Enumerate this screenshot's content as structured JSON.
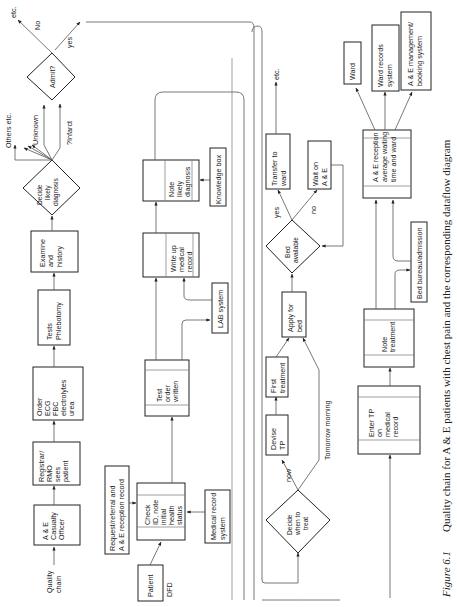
{
  "caption": {
    "figure_label": "Figure 6.1",
    "text": "Quality chain for A & E patients with chest pain and the corresponding dataflow diagram"
  },
  "quality_chain": {
    "label_line1": "Quality",
    "label_line2": "chain",
    "steps": [
      {
        "lines": [
          "A & E",
          "Casualty",
          "Officer"
        ]
      },
      {
        "lines": [
          "Registrar/",
          "RMO",
          "sees",
          "patient"
        ]
      },
      {
        "lines": [
          "Order",
          "ECG",
          "FBC",
          "electrolytes",
          "urea"
        ]
      },
      {
        "lines": [
          "Tests",
          "Phlebotomy"
        ]
      },
      {
        "lines": [
          "Examine",
          "and",
          "history"
        ]
      }
    ],
    "decide_diagnosis": {
      "lines": [
        "Decide",
        "likely",
        "diagnosis"
      ]
    },
    "diagnosis_branches": {
      "others": "Others etc.",
      "unknown": "Unknown",
      "infarct": "?Infarct"
    },
    "admit": {
      "label": "Admit?",
      "no": "No",
      "yes": "yes",
      "etc": "etc."
    }
  },
  "dfd": {
    "label": "DFD",
    "externals": {
      "patient": "Patient",
      "request": [
        "Request/referral and",
        "A & E reception record"
      ],
      "medical_record_system": [
        "Medical record",
        "system"
      ],
      "lab_system": "LAB system",
      "knowledge_box": "Knowledge box"
    },
    "processes": [
      {
        "lines": [
          "Check",
          "ID, note",
          "initial",
          "health",
          "status"
        ]
      },
      {
        "lines": [
          "Test",
          "order",
          "written"
        ]
      },
      {
        "lines": [
          "Write up",
          "medical",
          "record"
        ]
      },
      {
        "lines": [
          "Note",
          "likely",
          "diagnosis"
        ]
      }
    ]
  },
  "treatment_chain": {
    "decide_when": {
      "lines": [
        "Decide",
        "when to",
        "treat"
      ]
    },
    "now": "now",
    "tomorrow": "Tomorrow morning",
    "devise_tp": [
      "Devise",
      "TP"
    ],
    "first_treatment": [
      "First",
      "treatment"
    ],
    "apply_bed": [
      "Apply for",
      "bed"
    ],
    "bed_available": [
      "Bed",
      "available"
    ],
    "yes": "yes",
    "no": "no",
    "transfer": [
      "Transfer to",
      "ward"
    ],
    "wait": [
      "Wait on",
      "A & E"
    ],
    "etc": "etc."
  },
  "treatment_dfd": {
    "enter_tp": [
      "Enter TP",
      "on",
      "medical",
      "record"
    ],
    "note_treatment": [
      "Note",
      "treatment"
    ],
    "bed_bureau": "Bed bureau/admission",
    "reception": [
      "A & E reception",
      "average waiting",
      "time and ward"
    ],
    "ward": "Ward",
    "ward_records": [
      "Ward records",
      "system"
    ],
    "booking": [
      "A & E management/",
      "booking system"
    ]
  }
}
